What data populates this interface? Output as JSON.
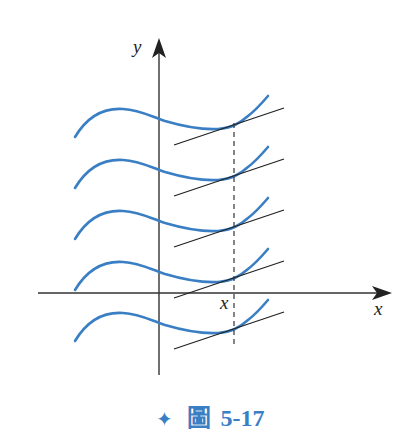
{
  "figure": {
    "axes": {
      "x_label": "x",
      "y_label": "y",
      "x_marker_label": "x"
    },
    "curves": {
      "count": 5,
      "color": "#3a7fc4",
      "vertical_spacing": 51,
      "description": "Family of vertically shifted curves y = F(x) + C, each with parallel tangent lines at the same x"
    },
    "tangent_lines": {
      "color": "#222222",
      "count": 5
    },
    "dashed_line": {
      "color": "#333333"
    }
  },
  "caption": {
    "icon": "✦",
    "label": "圖",
    "number": "5-17"
  }
}
